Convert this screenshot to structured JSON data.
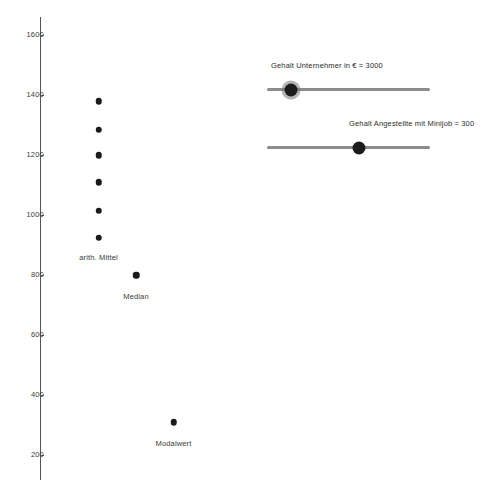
{
  "chart_data": {
    "type": "scatter",
    "title": "",
    "xlabel": "",
    "ylabel": "",
    "ylim": [
      200,
      1600
    ],
    "xlim": [
      0,
      10
    ],
    "grid": false,
    "legend_position": "none",
    "yticks": [
      1600,
      1400,
      1200,
      1000,
      800,
      600,
      400,
      200
    ],
    "ytick_labels": [
      "1600",
      "1400",
      "1200",
      "1000",
      "800",
      "600",
      "400",
      "200"
    ],
    "series": [
      {
        "name": "arith. Mittel",
        "annotation": "arith. Mittel",
        "x": [
          1.95,
          1.95,
          1.95,
          1.95,
          1.95,
          1.95
        ],
        "values": [
          1380,
          1285,
          1200,
          1110,
          1015,
          925
        ]
      },
      {
        "name": "Median",
        "annotation": "Median",
        "x": [
          3.2
        ],
        "values": [
          800
        ]
      },
      {
        "name": "Modalwert",
        "annotation": "Modalwert",
        "x": [
          4.45
        ],
        "values": [
          310
        ]
      }
    ],
    "annotations": [
      {
        "text": "arith. Mittel",
        "x": 1.95,
        "y": 870
      },
      {
        "text": "Median",
        "x": 3.2,
        "y": 740
      },
      {
        "text": "Modalwert",
        "x": 4.45,
        "y": 250
      }
    ]
  },
  "controls": {
    "sliders": [
      {
        "name": "gehalt-unternehmer",
        "label": "Gehalt Unternehmer in € = 3000",
        "value": 3000,
        "fill_fraction": 0.145
      },
      {
        "name": "gehalt-angestellte-minijob",
        "label": "Gehalt Angestellte mit Minijob = 300",
        "value": 300,
        "fill_fraction": 0.55
      }
    ]
  },
  "colors": {
    "dot": "#1a1a1a",
    "axis": "#555555",
    "track": "#8c8c8c",
    "handle": "#1c1c1c",
    "text": "#3a3a3a",
    "background": "#ffffff"
  },
  "footer": {
    "note": ""
  }
}
